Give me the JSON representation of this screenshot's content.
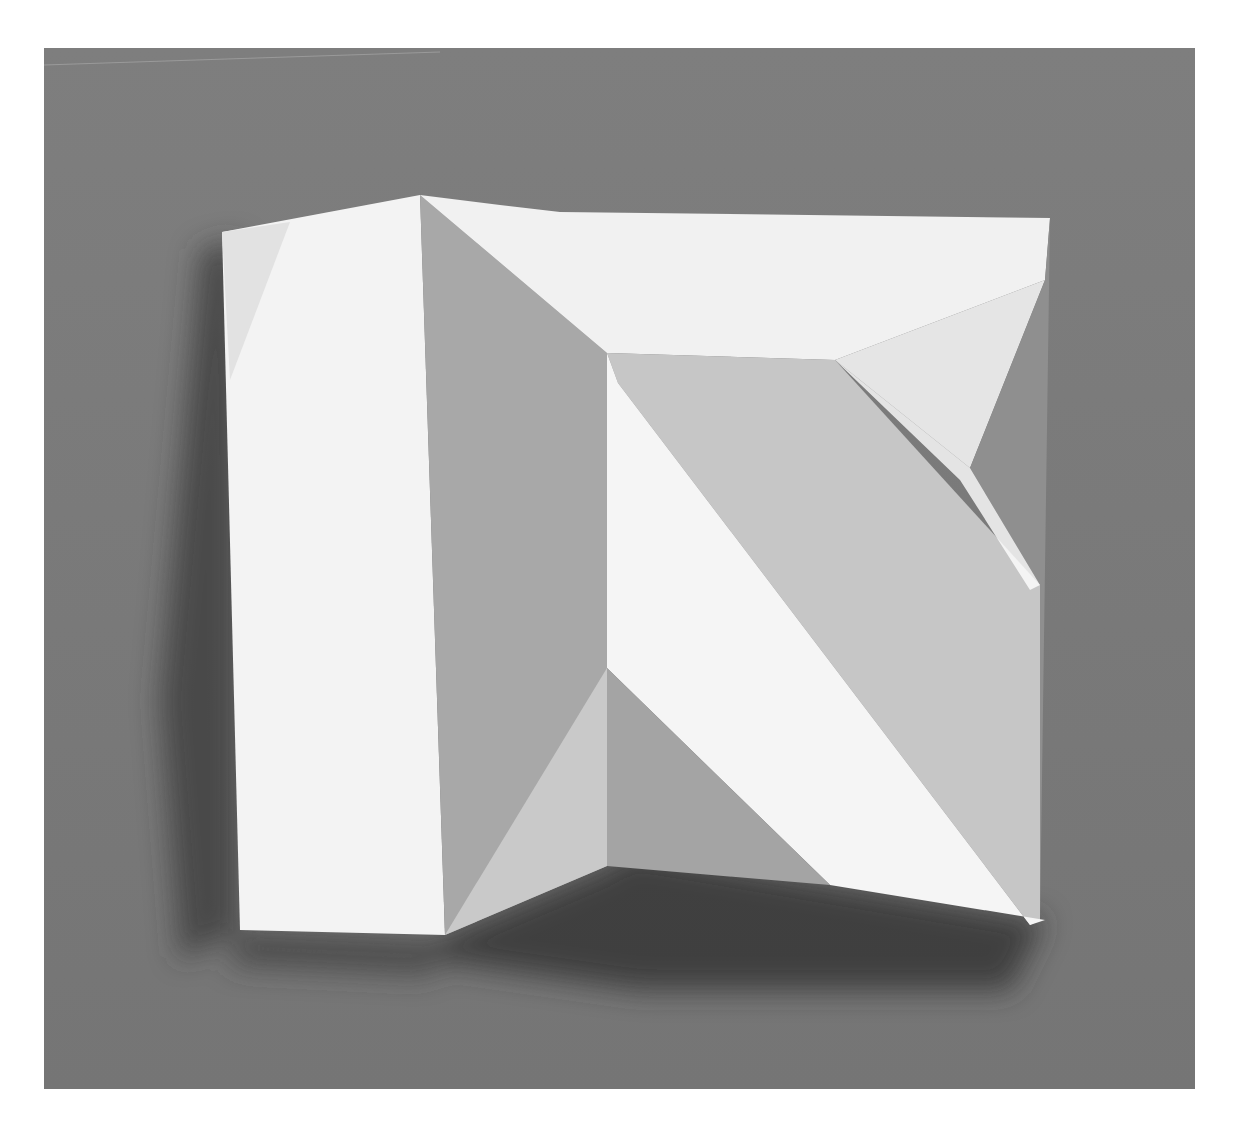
{
  "image": {
    "subject": "folded white paper relief sculpture on grey background",
    "background_color": "#7a7a7a",
    "page_color": "#ffffff",
    "paper_colors": {
      "lit": "#f4f4f4",
      "light": "#e6e6e6",
      "mid": "#c8c8c8",
      "shade": "#a9a9a9",
      "shadow": "#3a3a3a"
    }
  }
}
